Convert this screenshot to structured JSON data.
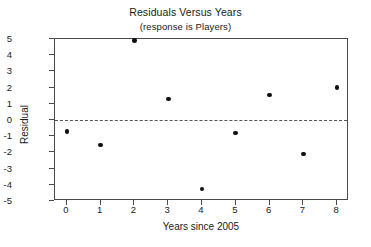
{
  "chart_data": {
    "type": "scatter",
    "title": "Residuals Versus Years",
    "subtitle": "(response is Players)",
    "xlabel": "Years since 2005",
    "ylabel": "Residual",
    "xlim": [
      -0.35,
      8.35
    ],
    "ylim": [
      -5.0,
      5.0
    ],
    "xticks": [
      0,
      1,
      2,
      3,
      4,
      5,
      6,
      7,
      8
    ],
    "xtick_labels": [
      "0",
      "1",
      "2",
      "3",
      "4",
      "5",
      "6",
      "7",
      "8"
    ],
    "yticks": [
      5,
      4,
      3,
      2,
      1,
      0,
      -1,
      -2,
      -3,
      -4,
      -5
    ],
    "ytick_labels": [
      "5",
      "4",
      "3",
      "2",
      "1",
      "0",
      "-1",
      "-2",
      "-3",
      "-4",
      "-5"
    ],
    "grid": false,
    "legend": false,
    "reference_line": {
      "value": 0,
      "style": "dashed",
      "orientation": "horizontal",
      "color": "#555555"
    },
    "marker": {
      "shape": "circle",
      "filled": true,
      "color": "#111111",
      "size": 4.6
    },
    "x": [
      0,
      1,
      2,
      3,
      4,
      5,
      6,
      7,
      8
    ],
    "y": [
      -0.7,
      -1.55,
      4.9,
      1.3,
      -4.25,
      -0.8,
      1.55,
      -2.1,
      2.0
    ],
    "points": [
      {
        "x": 0,
        "y": -0.7
      },
      {
        "x": 1,
        "y": -1.55
      },
      {
        "x": 2,
        "y": 4.9
      },
      {
        "x": 3,
        "y": 1.3
      },
      {
        "x": 4,
        "y": -4.25
      },
      {
        "x": 5,
        "y": -0.8
      },
      {
        "x": 6,
        "y": 1.55
      },
      {
        "x": 7,
        "y": -2.1
      },
      {
        "x": 8,
        "y": 2.0
      }
    ]
  }
}
